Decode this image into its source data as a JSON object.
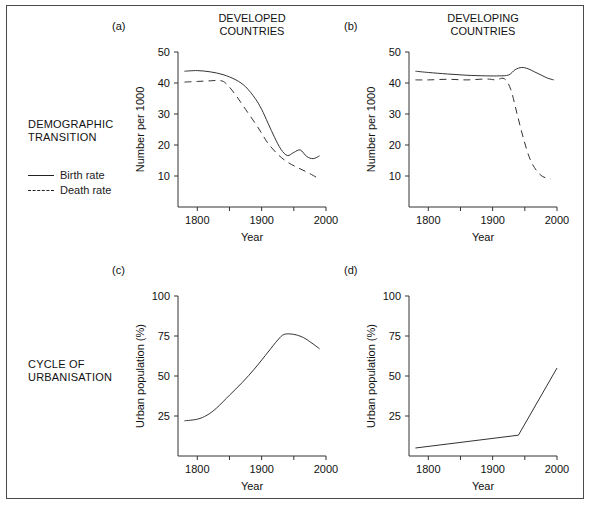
{
  "figure": {
    "row_labels": [
      {
        "name": "demographic-transition",
        "text": "DEMOGRAPHIC\nTRANSITION"
      },
      {
        "name": "cycle-of-urbanisation",
        "text": "CYCLE OF\nURBANISATION"
      }
    ],
    "legend": {
      "items": [
        {
          "key": "solid",
          "label": "Birth rate"
        },
        {
          "key": "dashed",
          "label": "Death rate"
        }
      ]
    },
    "line_color": "#333333",
    "axis_color": "#333333"
  },
  "panels": {
    "a": {
      "tag": "(a)",
      "title": "DEVELOPED\nCOUNTRIES"
    },
    "b": {
      "tag": "(b)",
      "title": "DEVELOPING\nCOUNTRIES"
    },
    "c": {
      "tag": "(c)",
      "title": ""
    },
    "d": {
      "tag": "(d)",
      "title": ""
    }
  },
  "chart_data": [
    {
      "id": "a",
      "type": "line",
      "title": "DEVELOPED COUNTRIES",
      "panel_tag": "(a)",
      "xlabel": "Year",
      "ylabel": "Number per 1000",
      "xlim": [
        1770,
        2000
      ],
      "ylim": [
        0,
        50
      ],
      "xticks": [
        1800,
        1900,
        2000
      ],
      "xticks_minor": [
        1850,
        1950
      ],
      "yticks": [
        10,
        20,
        30,
        40,
        50
      ],
      "grid": false,
      "legend_position": "outside-left",
      "series": [
        {
          "name": "Birth rate",
          "style": "solid",
          "x": [
            1780,
            1800,
            1820,
            1840,
            1860,
            1875,
            1890,
            1900,
            1910,
            1920,
            1930,
            1940,
            1950,
            1960,
            1970,
            1980,
            1990
          ],
          "values": [
            43.8,
            44.0,
            43.6,
            42.7,
            41.0,
            38.8,
            35.0,
            31.5,
            27.0,
            22.5,
            18.6,
            16.6,
            17.6,
            18.4,
            16.3,
            15.6,
            16.5
          ]
        },
        {
          "name": "Death rate",
          "style": "dashed",
          "x": [
            1780,
            1800,
            1820,
            1835,
            1845,
            1860,
            1875,
            1890,
            1900,
            1910,
            1925,
            1940,
            1955,
            1970,
            1985
          ],
          "values": [
            40.3,
            40.5,
            40.7,
            40.8,
            39.8,
            36.0,
            31.5,
            27.0,
            23.8,
            20.5,
            17.0,
            14.5,
            12.8,
            11.3,
            9.6
          ]
        }
      ]
    },
    {
      "id": "b",
      "type": "line",
      "title": "DEVELOPING COUNTRIES",
      "panel_tag": "(b)",
      "xlabel": "Year",
      "ylabel": "Number per 1000",
      "xlim": [
        1770,
        2000
      ],
      "ylim": [
        0,
        50
      ],
      "xticks": [
        1800,
        1900,
        2000
      ],
      "xticks_minor": [
        1850,
        1950
      ],
      "yticks": [
        10,
        20,
        30,
        40,
        50
      ],
      "grid": false,
      "legend_position": "outside-left",
      "series": [
        {
          "name": "Birth rate",
          "style": "solid",
          "x": [
            1780,
            1800,
            1830,
            1860,
            1890,
            1910,
            1925,
            1935,
            1945,
            1955,
            1965,
            1975,
            1985,
            1995
          ],
          "values": [
            43.8,
            43.4,
            42.9,
            42.5,
            42.3,
            42.3,
            42.6,
            44.3,
            45.0,
            44.6,
            43.6,
            42.6,
            41.6,
            41.0
          ]
        },
        {
          "name": "Death rate",
          "style": "dashed",
          "x": [
            1780,
            1800,
            1830,
            1860,
            1890,
            1905,
            1918,
            1928,
            1938,
            1948,
            1958,
            1968,
            1978,
            1990
          ],
          "values": [
            41.0,
            41.0,
            41.2,
            41.0,
            41.3,
            41.0,
            41.4,
            38.0,
            30.0,
            22.0,
            15.5,
            11.8,
            9.8,
            9.0
          ]
        }
      ]
    },
    {
      "id": "c",
      "type": "line",
      "title": "",
      "panel_tag": "(c)",
      "xlabel": "Year",
      "ylabel": "Urban population (%)",
      "xlim": [
        1770,
        2000
      ],
      "ylim": [
        0,
        100
      ],
      "xticks": [
        1800,
        1900,
        2000
      ],
      "xticks_minor": [
        1850,
        1950
      ],
      "yticks": [
        25,
        50,
        75,
        100
      ],
      "grid": false,
      "series": [
        {
          "name": "Urban population",
          "style": "solid",
          "x": [
            1780,
            1800,
            1815,
            1830,
            1850,
            1870,
            1890,
            1910,
            1925,
            1935,
            1950,
            1965,
            1980,
            1990
          ],
          "values": [
            22.0,
            23.0,
            25.5,
            30.0,
            38.0,
            46.0,
            55.0,
            65.0,
            72.5,
            76.0,
            76.0,
            74.0,
            70.0,
            67.0
          ]
        }
      ]
    },
    {
      "id": "d",
      "type": "line",
      "title": "",
      "panel_tag": "(d)",
      "xlabel": "Year",
      "ylabel": "Urban population (%)",
      "xlim": [
        1770,
        2000
      ],
      "ylim": [
        0,
        100
      ],
      "xticks": [
        1800,
        1900,
        2000
      ],
      "xticks_minor": [
        1850,
        1950
      ],
      "yticks": [
        25,
        50,
        75,
        100
      ],
      "grid": false,
      "series": [
        {
          "name": "Urban population",
          "style": "solid",
          "x": [
            1780,
            1940,
            2000
          ],
          "values": [
            5.0,
            13.0,
            55.0
          ]
        }
      ]
    }
  ]
}
